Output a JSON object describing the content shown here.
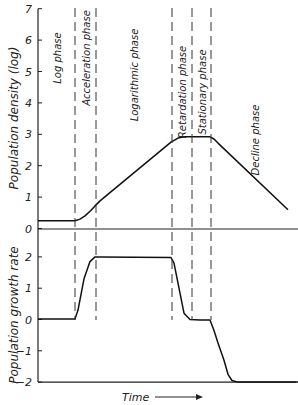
{
  "chart_data": [
    {
      "type": "line",
      "title": "",
      "ylabel": "Population density (log)",
      "xlabel": "",
      "ylim": [
        0,
        7
      ],
      "yticks": [
        0,
        1,
        2,
        3,
        4,
        5,
        6,
        7
      ],
      "grid": false,
      "x": [
        0,
        37,
        42,
        47,
        52,
        57,
        62,
        133,
        140,
        146,
        152,
        162,
        172,
        176,
        180,
        250
      ],
      "series": [
        {
          "name": "Population density",
          "values": [
            0.25,
            0.25,
            0.3,
            0.4,
            0.55,
            0.72,
            0.88,
            2.75,
            2.88,
            2.92,
            2.92,
            2.92,
            2.92,
            2.85,
            2.72,
            0.6
          ]
        }
      ]
    },
    {
      "type": "line",
      "title": "",
      "ylabel": "Population growth rate",
      "xlabel": "Time",
      "ylim": [
        -2,
        2
      ],
      "yticks": [
        -2,
        -1,
        0,
        1,
        2
      ],
      "grid": false,
      "x": [
        0,
        37,
        40,
        46,
        52,
        57,
        62,
        133,
        136,
        146,
        152,
        162,
        172,
        176,
        180,
        186,
        190,
        194,
        200,
        260
      ],
      "series": [
        {
          "name": "Population growth rate",
          "values": [
            0.02,
            0.02,
            0.3,
            1.3,
            1.85,
            2.0,
            2.0,
            1.98,
            1.8,
            0.2,
            0.0,
            -0.02,
            -0.02,
            -0.35,
            -0.75,
            -1.3,
            -1.75,
            -1.95,
            -2.0,
            -2.0
          ]
        }
      ]
    }
  ],
  "phases": [
    {
      "label": "Log phase",
      "x_start": 0,
      "x_end": 37
    },
    {
      "label": "Acceleration phase",
      "x_start": 37,
      "x_end": 58
    },
    {
      "label": "Logarithmic phase",
      "x_start": 58,
      "x_end": 134
    },
    {
      "label": "Retardation phase",
      "x_start": 134,
      "x_end": 154
    },
    {
      "label": "Stationary phase",
      "x_start": 154,
      "x_end": 173
    },
    {
      "label": "Decline phase",
      "x_start": 173,
      "x_end": 260
    }
  ],
  "phase_boundaries_x": [
    37,
    58,
    134,
    154,
    173
  ],
  "labels": {
    "upper_ylabel": "Population density (log)",
    "lower_ylabel": "Population growth rate",
    "time_label": "Time"
  }
}
